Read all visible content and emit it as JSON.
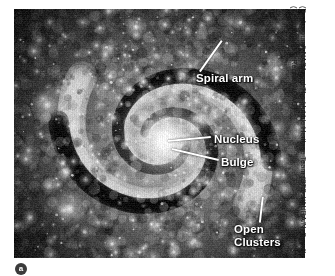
{
  "figure": {
    "marker_label": "a",
    "credit": "(Background) NASA and The Hubble Heritage Team (STScI/AURA/N. Scoville (Caltech) and T. Rector (NOAO)"
  },
  "callouts": [
    {
      "id": "spiral-arm",
      "label": "Spiral arm",
      "label_x": 182,
      "label_y": 63,
      "leader": {
        "x1": 208,
        "y1": 31,
        "x2": 186,
        "y2": 62
      }
    },
    {
      "id": "nucleus",
      "label": "Nucleus",
      "label_x": 200,
      "label_y": 124,
      "leader": {
        "x1": 154,
        "y1": 131,
        "x2": 197,
        "y2": 127
      }
    },
    {
      "id": "bulge",
      "label": "Bulge",
      "label_x": 207,
      "label_y": 147,
      "leader": {
        "x1": 158,
        "y1": 139,
        "x2": 205,
        "y2": 150
      }
    },
    {
      "id": "open-clusters",
      "label": "Open\nClusters",
      "label_x": 220,
      "label_y": 214,
      "leader": {
        "x1": 249,
        "y1": 187,
        "x2": 246,
        "y2": 213
      }
    }
  ],
  "colors": {
    "label_text": "#ffffff",
    "leader_line": "#ffffff",
    "credit_text": "#1b1b1b",
    "page_background": "#ffffff",
    "photo_dark": "#121212",
    "photo_mid": "#6b6b6b",
    "photo_light": "#f2f2f2"
  },
  "photo": {
    "frame": {
      "x": 14,
      "y": 9,
      "width": 291,
      "height": 249
    },
    "nucleus": {
      "x": 151,
      "y": 132,
      "radius": 26
    },
    "bulge": {
      "x": 151,
      "y": 132,
      "radius": 62
    },
    "arms": 2,
    "grain": "halftone"
  }
}
